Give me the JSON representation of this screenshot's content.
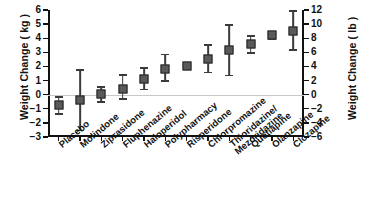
{
  "chart_data": {
    "type": "scatter",
    "title": "",
    "xlabel": "",
    "ylabel": "Weight Change  ( kg )",
    "ylabel_right": "Weight Change  ( lb )",
    "ylim": [
      -3,
      6
    ],
    "yticks": [
      6,
      5,
      4,
      3,
      2,
      1,
      0,
      -1,
      -2,
      -3
    ],
    "ylim_right": [
      -6,
      12
    ],
    "yticks_right": [
      12,
      10,
      8,
      6,
      4,
      2,
      0,
      -2,
      -4,
      -6
    ],
    "grid": false,
    "legend": null,
    "zero_reference_line": true,
    "marker_style": "filled-square-with-error-bars",
    "categories": [
      "Placebo",
      "Molindone",
      "Ziprasidone",
      "Fluphenazine",
      "Haloperidol",
      "Polypharmacy",
      "Risperidone",
      "Chlorpromazine",
      "Thioridazine/ Mezoridazine",
      "Quetiapine",
      "Olanzapine",
      "Clozapine"
    ],
    "category_labels_two_line": [
      null,
      null,
      null,
      null,
      null,
      null,
      null,
      null,
      [
        "Thioridazine/",
        "Mezoridazine"
      ],
      null,
      null,
      null
    ],
    "values": [
      -0.75,
      -0.4,
      0.05,
      0.4,
      1.1,
      1.85,
      2.0,
      2.5,
      3.2,
      3.6,
      4.2,
      4.5
    ],
    "error_low": [
      -1.45,
      -2.6,
      -0.6,
      -0.35,
      0.3,
      0.9,
      1.75,
      1.5,
      1.3,
      2.9,
      3.85,
      3.1
    ],
    "error_high": [
      -0.1,
      1.8,
      0.6,
      1.45,
      1.95,
      2.9,
      2.3,
      3.6,
      5.0,
      4.2,
      4.5,
      6.0
    ]
  },
  "axes": {
    "left_title": "Weight Change  ( kg )",
    "right_title": "Weight Change  ( lb )"
  }
}
